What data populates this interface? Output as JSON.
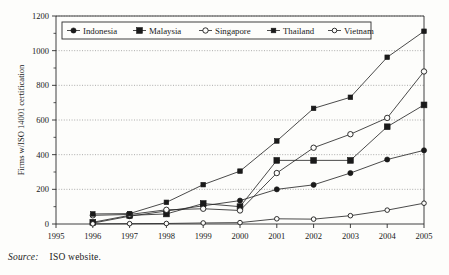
{
  "figure": {
    "source_label": "Source:",
    "source_text": "ISO website."
  },
  "chart_data": {
    "type": "line",
    "title": "",
    "xlabel": "",
    "ylabel": "Firms w/ISO 14001 certification",
    "x": [
      1995,
      1996,
      1997,
      1998,
      1999,
      2000,
      2001,
      2002,
      2003,
      2004,
      2005
    ],
    "categories": [
      "1995",
      "1996",
      "1997",
      "1998",
      "1999",
      "2000",
      "2001",
      "2002",
      "2003",
      "2004",
      "2005"
    ],
    "xlim": [
      1995,
      2005
    ],
    "ylim": [
      0,
      1200
    ],
    "yticks": [
      0,
      200,
      400,
      600,
      800,
      1000,
      1200
    ],
    "xticks": [
      1995,
      1996,
      1997,
      1998,
      1999,
      2000,
      2001,
      2002,
      2003,
      2004,
      2005
    ],
    "grid": true,
    "grid_style": "dotted-horizontal",
    "legend_position": "top-center-inside",
    "series": [
      {
        "name": "Indonesia",
        "marker": "filled-circle",
        "x": [
          1996,
          1997,
          1998,
          1999,
          2000,
          2001,
          2002,
          2003,
          2004,
          2005
        ],
        "values": [
          5,
          45,
          75,
          105,
          135,
          200,
          226,
          294,
          372,
          425
        ]
      },
      {
        "name": "Malaysia",
        "marker": "filled-square",
        "x": [
          1996,
          1997,
          1998,
          1999,
          2000,
          2001,
          2002,
          2003,
          2004,
          2005
        ],
        "values": [
          10,
          50,
          58,
          118,
          100,
          367,
          367,
          367,
          561,
          687
        ]
      },
      {
        "name": "Singapore",
        "marker": "open-circle",
        "x": [
          1996,
          1997,
          1998,
          1999,
          2000,
          2001,
          2002,
          2003,
          2004,
          2005
        ],
        "values": [
          50,
          55,
          82,
          88,
          78,
          294,
          440,
          518,
          612,
          880
        ]
      },
      {
        "name": "Thailand",
        "marker": "filled-square-small",
        "x": [
          1996,
          1997,
          1998,
          1999,
          2000,
          2001,
          2002,
          2003,
          2004,
          2005
        ],
        "values": [
          58,
          60,
          125,
          227,
          305,
          479,
          667,
          731,
          962,
          1112
        ]
      },
      {
        "name": "Vietnam",
        "marker": "open-circle-small",
        "x": [
          1996,
          1997,
          1998,
          1999,
          2000,
          2001,
          2002,
          2003,
          2004,
          2005
        ],
        "values": [
          1,
          2,
          3,
          6,
          8,
          30,
          28,
          48,
          80,
          120
        ]
      }
    ]
  }
}
